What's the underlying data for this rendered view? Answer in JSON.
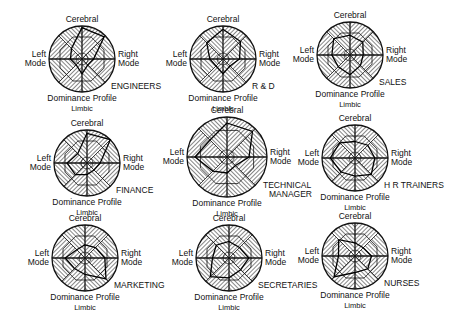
{
  "figure": {
    "axis_labels": {
      "top": "Cerebral",
      "left_line1": "Left",
      "left_line2": "Mode",
      "right_line1": "Right",
      "right_line2": "Mode",
      "bottom_title": "Dominance Profile",
      "bottom": "Limbic"
    },
    "panels": [
      {
        "name": "ENGINEERS",
        "cx": 82,
        "cy": 59,
        "r": 33,
        "profile": [
          0.95,
          0.95,
          0.35,
          0.25,
          0.45,
          0.25,
          0.35,
          0.45
        ]
      },
      {
        "name": "R & D",
        "cx": 223,
        "cy": 59,
        "r": 33,
        "profile": [
          0.9,
          0.75,
          0.5,
          0.3,
          0.45,
          0.3,
          0.4,
          0.7
        ]
      },
      {
        "name": "SALES",
        "cx": 350,
        "cy": 55,
        "r": 33,
        "profile": [
          0.6,
          0.55,
          0.4,
          0.45,
          0.6,
          0.5,
          0.55,
          0.7
        ]
      },
      {
        "name": "FINANCE",
        "cx": 87,
        "cy": 163,
        "r": 33,
        "profile": [
          0.9,
          1.0,
          0.4,
          0.3,
          0.35,
          0.5,
          0.6,
          0.4
        ]
      },
      {
        "name_line1": "TECHNICAL",
        "name_line2": "MANAGER",
        "name": "TECHNICAL MANAGER",
        "cx": 227,
        "cy": 157,
        "r": 40,
        "profile": [
          0.85,
          0.9,
          0.55,
          0.3,
          0.4,
          0.5,
          0.8,
          0.6
        ]
      },
      {
        "name": "H R TRAINERS",
        "cx": 355,
        "cy": 158,
        "r": 33,
        "profile": [
          0.5,
          0.55,
          0.6,
          0.7,
          0.55,
          0.6,
          0.75,
          0.65
        ]
      },
      {
        "name": "MARKETING",
        "cx": 85,
        "cy": 258,
        "r": 33,
        "profile": [
          0.4,
          0.45,
          0.6,
          0.9,
          0.5,
          0.45,
          0.6,
          0.35
        ]
      },
      {
        "name": "SECRETARIES",
        "cx": 229,
        "cy": 258,
        "r": 33,
        "profile": [
          0.5,
          0.45,
          0.6,
          0.5,
          0.6,
          0.8,
          0.5,
          0.55
        ]
      },
      {
        "name": "NURSES",
        "cx": 355,
        "cy": 256,
        "r": 33,
        "profile": [
          0.4,
          0.35,
          0.5,
          0.55,
          0.5,
          0.9,
          0.5,
          0.7
        ]
      }
    ]
  }
}
